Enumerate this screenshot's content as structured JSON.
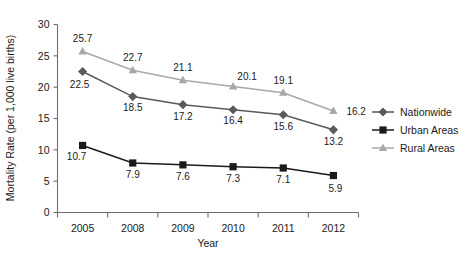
{
  "chart_data": {
    "type": "line",
    "title": "",
    "xlabel": "Year",
    "ylabel": "Mortality Rate (per 1,000 live births)",
    "categories": [
      "2005",
      "2008",
      "2009",
      "2010",
      "2011",
      "2012"
    ],
    "ylim": [
      0,
      30
    ],
    "yticks": [
      "0",
      "5",
      "10",
      "15",
      "20",
      "25",
      "30"
    ],
    "grid": false,
    "legend_position": "right",
    "series": [
      {
        "name": "Nationwide",
        "marker": "diamond",
        "color": "#5a5a5a",
        "values": [
          22.5,
          18.5,
          17.2,
          16.4,
          15.6,
          13.2
        ],
        "labels": [
          "22.5",
          "18.5",
          "17.2",
          "16.4",
          "15.6",
          "13.2"
        ]
      },
      {
        "name": "Urban Areas",
        "marker": "square",
        "color": "#1a1a1a",
        "values": [
          10.7,
          7.9,
          7.6,
          7.3,
          7.1,
          5.9
        ],
        "labels": [
          "10.7",
          "7.9",
          "7.6",
          "7.3",
          "7.1",
          "5.9"
        ]
      },
      {
        "name": "Rural Areas",
        "marker": "triangle",
        "color": "#a8a8a8",
        "values": [
          25.7,
          22.7,
          21.1,
          20.1,
          19.1,
          16.2
        ],
        "labels": [
          "25.7",
          "22.7",
          "21.1",
          "20.1",
          "19.1",
          "16.2"
        ]
      }
    ]
  },
  "legend": {
    "items": [
      {
        "label": "Nationwide"
      },
      {
        "label": "Urban Areas"
      },
      {
        "label": "Rural Areas"
      }
    ]
  }
}
